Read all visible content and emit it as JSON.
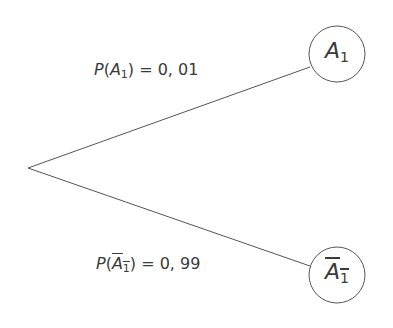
{
  "diagram": {
    "type": "probability-tree",
    "root": {
      "x": 28,
      "y": 168
    },
    "branches": [
      {
        "event": "A",
        "subscript": "1",
        "complement": false,
        "prob_prefix": "P(",
        "prob_suffix": ") = 0, 01",
        "probability": "0,01",
        "node": {
          "cx": 337,
          "cy": 54,
          "r": 28
        },
        "line_end": {
          "x": 310,
          "y": 67
        }
      },
      {
        "event": "A",
        "subscript": "1",
        "complement": true,
        "prob_prefix": "P(",
        "prob_suffix": ") = 0, 99",
        "probability": "0,99",
        "node": {
          "cx": 337,
          "cy": 275,
          "r": 28
        },
        "line_end": {
          "x": 310,
          "y": 266
        }
      }
    ],
    "colors": {
      "stroke": "#555555",
      "text": "#3a3a3a",
      "background": "#ffffff"
    }
  }
}
